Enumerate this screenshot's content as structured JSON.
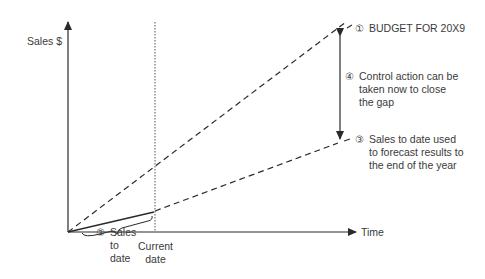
{
  "axes": {
    "y_label": "Sales $",
    "x_label": "Time"
  },
  "markers": {
    "current_date_line1": "Current",
    "current_date_line2": "date"
  },
  "annotations": {
    "budget": {
      "number": "①",
      "text": "BUDGET FOR 20X9"
    },
    "sales_to_date": {
      "number": "②",
      "line1": "Sales",
      "line2": "to",
      "line3": "date"
    },
    "forecast": {
      "number": "③",
      "line1": "Sales to date used",
      "line2": "to forecast results to",
      "line3": "the end of the year"
    },
    "control": {
      "number": "④",
      "line1": "Control action can be",
      "line2": "taken now to close",
      "line3": "the gap"
    }
  },
  "colors": {
    "line": "#2a2a2a",
    "text": "#3a3a3a"
  }
}
